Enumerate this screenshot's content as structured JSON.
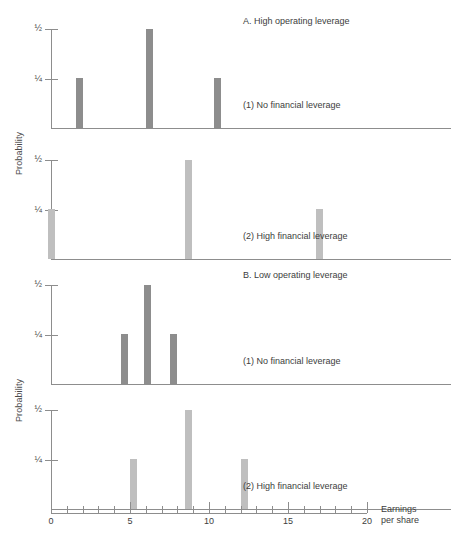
{
  "figure": {
    "ylabel": "Probability",
    "xlabel_line1": "Earnings",
    "xlabel_line2": "per share",
    "group_a_title": "A. High operating leverage",
    "group_b_title": "B. Low operating leverage",
    "note_no_leverage": "(1) No financial leverage",
    "note_high_leverage": "(2) High financial leverage",
    "ytick_half": "½",
    "ytick_quarter": "¼"
  },
  "chart_data": {
    "type": "bar",
    "xlabel": "Earnings per share",
    "ylabel": "Probability",
    "xlim": [
      0,
      20
    ],
    "ylim": [
      0,
      0.5
    ],
    "xticks": [
      0,
      1,
      2,
      3,
      4,
      5,
      6,
      7,
      8,
      9,
      10,
      11,
      12,
      13,
      14,
      15,
      16,
      17,
      18,
      19,
      20
    ],
    "xtick_labels": [
      "0",
      "",
      "",
      "",
      "",
      "5",
      "",
      "",
      "",
      "",
      "10",
      "",
      "",
      "",
      "",
      "15",
      "",
      "",
      "",
      "",
      "20"
    ],
    "yticks": [
      0.25,
      0.5
    ],
    "ytick_labels": [
      "¼",
      "½"
    ],
    "grid": false,
    "legend": "none",
    "panels": [
      {
        "id": "A1",
        "group": "A. High operating leverage",
        "label": "(1) No financial leverage",
        "bar_color": "#8d8d8d",
        "x": [
          1.6,
          6.0,
          10.3
        ],
        "values": [
          0.25,
          0.5,
          0.25
        ]
      },
      {
        "id": "A2",
        "group": "A. High operating leverage",
        "label": "(2) High financial leverage",
        "bar_color": "#bfbfbf",
        "x": [
          0.0,
          8.5,
          16.8
        ],
        "values": [
          0.25,
          0.5,
          0.25
        ]
      },
      {
        "id": "B1",
        "group": "B. Low operating leverage",
        "label": "(1) No financial leverage",
        "bar_color": "#8d8d8d",
        "x": [
          4.4,
          5.9,
          7.5
        ],
        "values": [
          0.25,
          0.5,
          0.25
        ]
      },
      {
        "id": "B2",
        "group": "B. Low operating leverage",
        "label": "(2) High financial leverage",
        "bar_color": "#bfbfbf",
        "x": [
          5.0,
          8.5,
          12.0
        ],
        "values": [
          0.25,
          0.5,
          0.25
        ]
      }
    ]
  }
}
